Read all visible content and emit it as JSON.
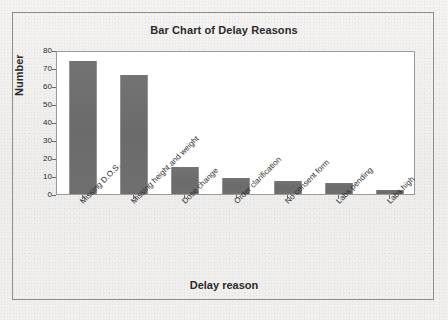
{
  "chart_data": {
    "type": "bar",
    "title": "Bar Chart of Delay Reasons",
    "xlabel": "Delay reason",
    "ylabel": "Number",
    "categories": [
      "Missing D.O.S.",
      "Missing height and weight",
      "Dose change",
      "Order clarification",
      "No consent form",
      "Labs pending",
      "Labs high"
    ],
    "values": [
      74,
      66,
      15,
      9,
      7,
      6,
      2
    ],
    "ylim": [
      0,
      80
    ],
    "yticks": [
      0,
      10,
      20,
      30,
      40,
      50,
      60,
      70,
      80
    ],
    "ytick_labels": [
      "0",
      "10",
      "20",
      "30",
      "40",
      "50",
      "60",
      "70",
      "80"
    ],
    "grid": false,
    "legend": null,
    "bar_color": "#6e6e6e",
    "plot_background": "#ffffff",
    "figure_background": "#f0efed",
    "axis_color": "#9a9a9a"
  }
}
